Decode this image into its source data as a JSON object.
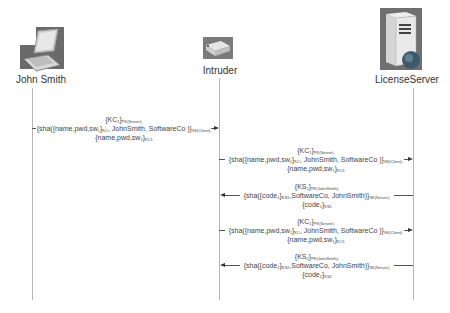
{
  "actors": [
    {
      "name": "John Smith",
      "icon": "laptop-icon"
    },
    {
      "name": "Intruder",
      "icon": "network-device-icon"
    },
    {
      "name": "LicenseServer",
      "icon": "server-icon"
    }
  ],
  "messages": [
    {
      "from": "John Smith",
      "to": "Intruder",
      "direction": "right",
      "line1": "{KC1}PK(Server),",
      "line2": "{sha({name,pwd,sw1}KC, JohnSmith, SoftwareCo )}SK(Client),",
      "line3": "{name,pwd,sw1}KC1"
    },
    {
      "from": "Intruder",
      "to": "LicenseServer",
      "direction": "right",
      "line1": "{KC1}PK(Server),",
      "line2": "{sha({name,pwd,sw1}KC, JohnSmith, SoftwareCo )}SK(Client),",
      "line3": "{name,pwd,sw1}KC1"
    },
    {
      "from": "LicenseServer",
      "to": "Intruder",
      "direction": "left",
      "line1": "{KS1}PK(JohnSmith),",
      "line2": "{sha({code1}KS1,SoftwareCo, JohnSmith)}SK(Server),",
      "line3": "{code1}KS1"
    },
    {
      "from": "Intruder",
      "to": "LicenseServer",
      "direction": "right",
      "line1": "{KC1}PK(Server),",
      "line2": "{sha({name,pwd,sw1}KC, JohnSmith, SoftwareCo )}SK(Client),",
      "line3": "{name,pwd,sw1}KC1"
    },
    {
      "from": "LicenseServer",
      "to": "Intruder",
      "direction": "left",
      "line1": "{KS2}PK(JohnSmith),",
      "line2": "{sha({code2}KS2,SoftwareCo, JohnSmith)}SK(Server),",
      "line3": "{code2}KS2"
    }
  ]
}
